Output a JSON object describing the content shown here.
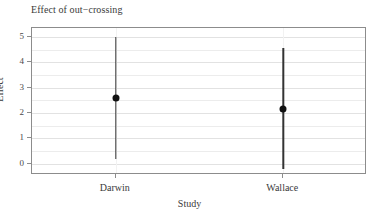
{
  "chart_data": {
    "type": "scatter",
    "title": "Effect of out−crossing",
    "xlabel": "Study",
    "ylabel": "Effect",
    "categories": [
      "Darwin",
      "Wallace"
    ],
    "values": [
      2.57,
      2.15
    ],
    "error_low": [
      0.2,
      -0.2
    ],
    "error_high": [
      5.0,
      4.55
    ],
    "ylim": [
      -0.45,
      5.35
    ],
    "ytick_labels": [
      "0",
      "1",
      "2",
      "3",
      "4",
      "5"
    ],
    "ytick_values": [
      0,
      1,
      2,
      3,
      4,
      5
    ],
    "minor_gridline_values": [
      0.5,
      1.5,
      2.5,
      3.5,
      4.5
    ],
    "grid": true,
    "legend": "none",
    "series": [
      {
        "name": "Darwin",
        "estimate": 2.57,
        "ci_lower": 0.2,
        "ci_upper": 5.0
      },
      {
        "name": "Wallace",
        "estimate": 2.15,
        "ci_lower": -0.2,
        "ci_upper": 4.55
      }
    ]
  },
  "colors": {
    "point": "#111111",
    "errorbar": "#333333",
    "panel_border": "#8c8c8c",
    "gridline_major": "#e2e2e2",
    "gridline_minor": "#ececec",
    "text": "#3a3a3a",
    "background": "#ffffff"
  }
}
